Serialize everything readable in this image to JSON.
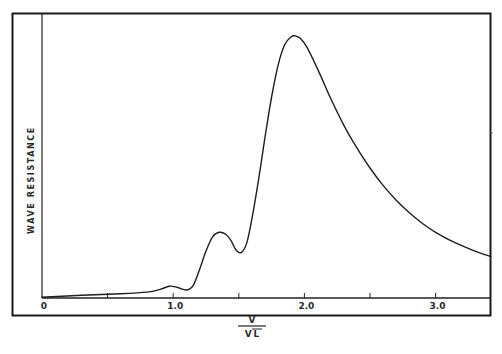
{
  "chart_data": {
    "type": "line",
    "title": "",
    "xlabel": "V / √L",
    "xlabel_numerator": "V",
    "xlabel_denominator": "√L",
    "ylabel": "WAVE RESISTANCE",
    "xlim": [
      0,
      3.42
    ],
    "ylim": [
      0,
      100
    ],
    "y_units": "relative (unlabeled axis)",
    "grid": false,
    "legend": null,
    "x_ticks": [
      0,
      0.5,
      1.0,
      1.5,
      2.0,
      2.5,
      3.0
    ],
    "x_tick_labels": [
      {
        "value": 0,
        "label": "0"
      },
      {
        "value": 1.0,
        "label": "1.0"
      },
      {
        "value": 2.0,
        "label": "2.0"
      },
      {
        "value": 3.0,
        "label": "3.0"
      }
    ],
    "series": [
      {
        "name": "Wave resistance",
        "x": [
          0.0,
          0.3,
          0.6,
          0.8,
          0.9,
          0.97,
          1.03,
          1.1,
          1.15,
          1.2,
          1.25,
          1.3,
          1.35,
          1.4,
          1.44,
          1.48,
          1.52,
          1.56,
          1.6,
          1.65,
          1.7,
          1.75,
          1.8,
          1.85,
          1.9,
          1.93,
          1.97,
          2.02,
          2.1,
          2.2,
          2.3,
          2.4,
          2.5,
          2.6,
          2.7,
          2.8,
          2.9,
          3.0,
          3.1,
          3.2,
          3.3,
          3.42
        ],
        "y": [
          0.3,
          1.0,
          1.6,
          2.2,
          3.2,
          4.4,
          4.0,
          3.0,
          4.5,
          10.5,
          17.5,
          22.8,
          24.5,
          23.8,
          21.5,
          17.8,
          17.0,
          20.5,
          29.5,
          44.0,
          60.0,
          75.0,
          87.0,
          94.5,
          97.5,
          97.8,
          96.8,
          93.5,
          85.5,
          74.5,
          64.5,
          56.0,
          48.5,
          42.0,
          36.5,
          31.8,
          27.8,
          24.5,
          21.8,
          19.5,
          17.5,
          15.5
        ]
      }
    ],
    "annotations": []
  },
  "colors": {
    "line": "#1e1e1e",
    "frame": "#1a1a1a",
    "background": "#ffffff"
  }
}
